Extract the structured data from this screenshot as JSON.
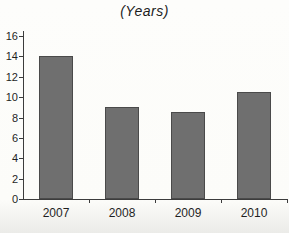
{
  "chart_data": {
    "type": "bar",
    "title": "(Years)",
    "categories": [
      "2007",
      "2008",
      "2009",
      "2010"
    ],
    "values": [
      14,
      9,
      8.5,
      10.5
    ],
    "xlabel": "",
    "ylabel": "",
    "ylim": [
      0,
      16
    ],
    "yticks": [
      0,
      2,
      4,
      6,
      8,
      10,
      12,
      14,
      16
    ],
    "grid": false,
    "legend": false,
    "colors": {
      "bar_fill": "#6f6f6f",
      "bar_border": "#4a4a4a",
      "axis": "#3c3c3c",
      "text": "#1f1f1f",
      "background": "#fcfcf9"
    }
  }
}
